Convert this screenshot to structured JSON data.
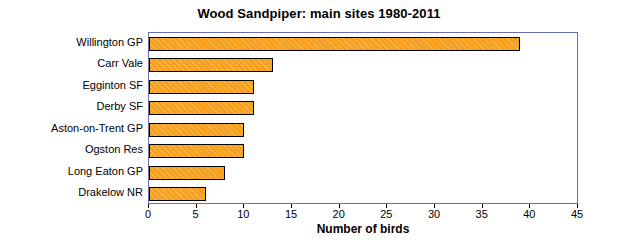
{
  "chart_data": {
    "type": "bar",
    "orientation": "horizontal",
    "title": "Wood Sandpiper: main sites 1980-2011",
    "xlabel": "Number of birds",
    "ylabel": "",
    "categories": [
      "Willington GP",
      "Carr Vale",
      "Egginton SF",
      "Derby SF",
      "Aston-on-Trent GP",
      "Ogston Res",
      "Long Eaton GP",
      "Drakelow NR"
    ],
    "values": [
      39,
      13,
      11,
      11,
      10,
      10,
      8,
      6
    ],
    "xlim": [
      0,
      45
    ],
    "xticks": [
      0,
      5,
      10,
      15,
      20,
      25,
      30,
      35,
      40,
      45
    ],
    "grid": false,
    "legend": false,
    "bar_color": "#f5a11e",
    "bar_edge_color": "#000000",
    "plot_border_color": "#6b6fa8"
  }
}
